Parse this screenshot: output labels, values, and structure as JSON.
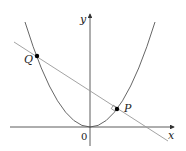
{
  "diagram": {
    "type": "parabola-with-normal-line",
    "axes": {
      "x_label": "x",
      "y_label": "y",
      "origin_label": "0"
    },
    "curve": {
      "name": "parabola",
      "equation_form": "y = x^2 (shape)"
    },
    "line": {
      "name": "normal-line",
      "passes_through": [
        "P",
        "Q"
      ]
    },
    "points": [
      {
        "label": "P",
        "description": "point on parabola where normal meets at right angle"
      },
      {
        "label": "Q",
        "description": "second intersection of normal with parabola"
      }
    ],
    "colors": {
      "axis": "#333333",
      "curve": "#555555",
      "line": "#999999",
      "point": "#000000"
    }
  }
}
